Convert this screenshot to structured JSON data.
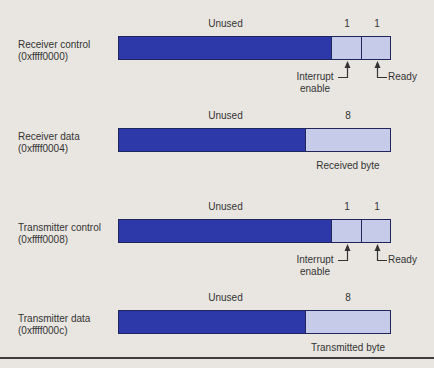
{
  "colors": {
    "background": "#e9e6e1",
    "unused_field": "#2d38a9",
    "active_field": "#c6cbe9",
    "field_border": "#20255c",
    "text": "#333333",
    "bottom_rule": "#3d3d3d"
  },
  "registers": [
    {
      "name": "Receiver control",
      "address": "(0xffff0000)",
      "unused": "Unused",
      "bit1": "1",
      "bit2": "1",
      "interrupt_line1": "Interrupt",
      "interrupt_line2": "enable",
      "ready": "Ready"
    },
    {
      "name": "Receiver data",
      "address": "(0xffff0004)",
      "unused": "Unused",
      "byte_width": "8",
      "byte_label": "Received byte"
    },
    {
      "name": "Transmitter control",
      "address": "(0xffff0008)",
      "unused": "Unused",
      "bit1": "1",
      "bit2": "1",
      "interrupt_line1": "Interrupt",
      "interrupt_line2": "enable",
      "ready": "Ready"
    },
    {
      "name": "Transmitter data",
      "address": "(0xffff000c)",
      "unused": "Unused",
      "byte_width": "8",
      "byte_label": "Transmitted byte"
    }
  ]
}
